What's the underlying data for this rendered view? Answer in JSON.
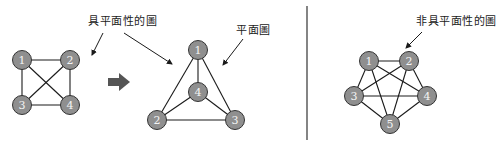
{
  "labels": {
    "planar_graph": "具平面性的圖",
    "plane_graph": "平面圖",
    "nonplanar_graph": "非具平面性的圖"
  },
  "colors": {
    "node_fill": "#8f8f8f",
    "node_stroke": "#333333",
    "edge": "#1a1a1a",
    "transform_arrow": "#555555",
    "divider": "#333333"
  },
  "graphs": {
    "k4_crossing": {
      "nodes": [
        {
          "id": "1",
          "x": 22,
          "y": 60
        },
        {
          "id": "2",
          "x": 70,
          "y": 60
        },
        {
          "id": "3",
          "x": 22,
          "y": 105
        },
        {
          "id": "4",
          "x": 70,
          "y": 105
        }
      ],
      "edges": [
        [
          "1",
          "2"
        ],
        [
          "1",
          "3"
        ],
        [
          "1",
          "4"
        ],
        [
          "2",
          "3"
        ],
        [
          "2",
          "4"
        ],
        [
          "3",
          "4"
        ]
      ]
    },
    "k4_plane": {
      "nodes": [
        {
          "id": "1",
          "x": 198,
          "y": 50
        },
        {
          "id": "4",
          "x": 198,
          "y": 92
        },
        {
          "id": "2",
          "x": 157,
          "y": 120
        },
        {
          "id": "3",
          "x": 235,
          "y": 120
        }
      ],
      "edges": [
        [
          "1",
          "2"
        ],
        [
          "1",
          "3"
        ],
        [
          "1",
          "4"
        ],
        [
          "2",
          "3"
        ],
        [
          "2",
          "4"
        ],
        [
          "3",
          "4"
        ]
      ]
    },
    "k5": {
      "nodes": [
        {
          "id": "1",
          "x": 369,
          "y": 61
        },
        {
          "id": "2",
          "x": 409,
          "y": 61
        },
        {
          "id": "3",
          "x": 354,
          "y": 96
        },
        {
          "id": "4",
          "x": 427,
          "y": 96
        },
        {
          "id": "5",
          "x": 390,
          "y": 124
        }
      ],
      "edges": [
        [
          "1",
          "2"
        ],
        [
          "1",
          "3"
        ],
        [
          "1",
          "4"
        ],
        [
          "1",
          "5"
        ],
        [
          "2",
          "3"
        ],
        [
          "2",
          "4"
        ],
        [
          "2",
          "5"
        ],
        [
          "3",
          "4"
        ],
        [
          "3",
          "5"
        ],
        [
          "4",
          "5"
        ]
      ]
    }
  },
  "pointer_arrows": [
    {
      "from": [
        103,
        33
      ],
      "to": [
        92,
        55
      ]
    },
    {
      "from": [
        124,
        33
      ],
      "to": [
        172,
        64
      ]
    },
    {
      "from": [
        243,
        39
      ],
      "to": [
        223,
        65
      ]
    },
    {
      "from": [
        422,
        32
      ],
      "to": [
        406,
        48
      ]
    }
  ]
}
